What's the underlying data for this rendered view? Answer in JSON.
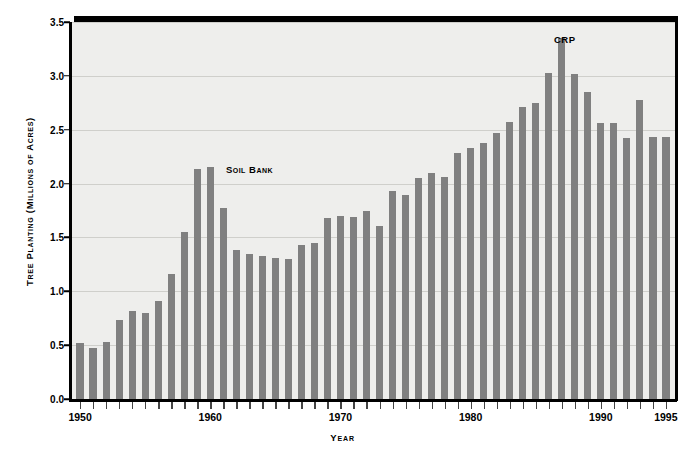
{
  "chart_data": {
    "type": "bar",
    "title": "",
    "xlabel": "Year",
    "ylabel": "Tree Planting (Millions of Acres)",
    "xlim": [
      1949.3,
      1995.7
    ],
    "ylim": [
      0.0,
      3.5
    ],
    "grid": true,
    "legend": "none",
    "bar_color": "#808080",
    "plot_background": "#eeeeec",
    "ytick_labels": [
      "0.0",
      "0.5",
      "1.0",
      "1.5",
      "2.0",
      "2.5",
      "3.0",
      "3.5"
    ],
    "ytick_values": [
      0.0,
      0.5,
      1.0,
      1.5,
      2.0,
      2.5,
      3.0,
      3.5
    ],
    "xtick_labels": [
      "1950",
      "1960",
      "1970",
      "1980",
      "1990",
      "1995"
    ],
    "xtick_values": [
      1950,
      1960,
      1970,
      1980,
      1990,
      1995
    ],
    "categories": [
      1950,
      1951,
      1952,
      1953,
      1954,
      1955,
      1956,
      1957,
      1958,
      1959,
      1960,
      1961,
      1962,
      1963,
      1964,
      1965,
      1966,
      1967,
      1968,
      1969,
      1970,
      1971,
      1972,
      1973,
      1974,
      1975,
      1976,
      1977,
      1978,
      1979,
      1980,
      1981,
      1982,
      1983,
      1984,
      1985,
      1986,
      1987,
      1988,
      1989,
      1990,
      1991,
      1992,
      1993,
      1994,
      1995
    ],
    "values": [
      0.52,
      0.47,
      0.53,
      0.73,
      0.82,
      0.8,
      0.91,
      1.16,
      1.55,
      2.14,
      2.15,
      1.77,
      1.38,
      1.35,
      1.33,
      1.31,
      1.3,
      1.43,
      1.45,
      1.68,
      1.7,
      1.69,
      1.75,
      1.61,
      1.93,
      1.89,
      2.05,
      2.1,
      2.06,
      2.28,
      2.33,
      2.38,
      2.47,
      2.57,
      2.71,
      2.75,
      3.03,
      3.35,
      3.02,
      2.85,
      2.56,
      2.56,
      2.42,
      2.78,
      2.43,
      2.43
    ],
    "annotations": [
      {
        "text": "Soil Bank",
        "x": 1961.2,
        "y": 2.13
      },
      {
        "text": "CRP",
        "x": 1986.4,
        "y": 3.33
      }
    ]
  }
}
